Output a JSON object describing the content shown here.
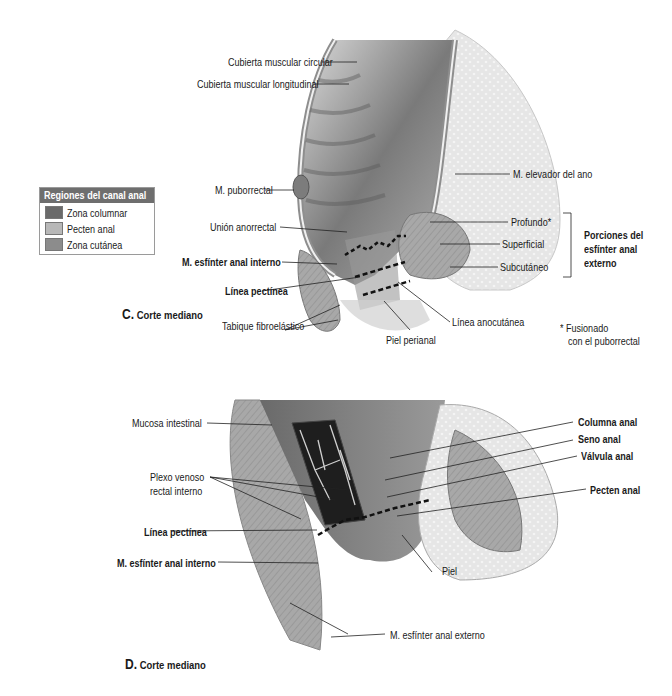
{
  "legend": {
    "title": "Regiones del canal anal",
    "items": [
      {
        "label": "Zona columnar",
        "color": "#6a6a6a"
      },
      {
        "label": "Pecten anal",
        "color": "#b8b8b8"
      },
      {
        "label": "Zona cutánea",
        "color": "#8c8c8c"
      }
    ]
  },
  "figure_c": {
    "caption_letter": "C.",
    "caption_text": "Corte mediano",
    "labels": {
      "circular": "Cubierta muscular circular",
      "longitudinal": "Cubierta muscular longitudinal",
      "puborrectal": "M. puborrectal",
      "union": "Unión anorrectal",
      "esfinter_interno": "M. esfínter anal interno",
      "linea_pectinea": "Línea pectínea",
      "tabique": "Tabique fibroelástico",
      "piel_perianal": "Piel perianal",
      "linea_anocutanea": "Línea anocutánea",
      "elevador": "M. elevador del ano",
      "profundo": "Profundo*",
      "superficial": "Superficial",
      "subcutaneo": "Subcutáneo",
      "porciones": [
        "Porciones del",
        "esfínter anal",
        "externo"
      ],
      "footnote": [
        "* Fusionado",
        "con el puborrectal"
      ]
    }
  },
  "figure_d": {
    "caption_letter": "D.",
    "caption_text": "Corte mediano",
    "labels": {
      "mucosa": "Mucosa intestinal",
      "plexo": [
        "Plexo venoso",
        "rectal interno"
      ],
      "linea_pectinea": "Línea pectínea",
      "esfinter_interno": "M. esfínter anal interno",
      "columna": "Columna anal",
      "seno": "Seno anal",
      "valvula": "Válvula anal",
      "pecten": "Pecten anal",
      "piel": "Piel",
      "esfinter_externo": "M. esfínter anal externo"
    }
  }
}
